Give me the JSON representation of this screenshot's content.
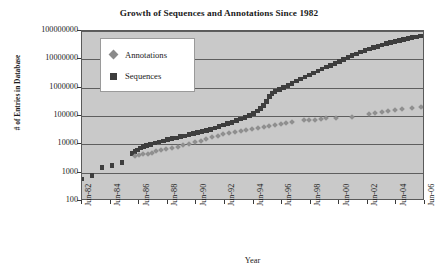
{
  "chart_data": {
    "type": "scatter",
    "title": "Growth of Sequences and Annotations Since 1982",
    "xlabel": "Year",
    "ylabel": "# of Entries in Database",
    "yscale": "log",
    "ylim": [
      100,
      100000000
    ],
    "ytick_labels": [
      "100000000",
      "10000000",
      "1000000",
      "100000",
      "10000",
      "1000",
      "100"
    ],
    "ytick_values": [
      100000000,
      10000000,
      1000000,
      100000,
      10000,
      1000,
      100
    ],
    "grid": true,
    "xtick_labels": [
      "Jun-82",
      "Jun-84",
      "Jun-86",
      "Jun-88",
      "Jun-90",
      "Jun-92",
      "Jun-94",
      "Jun-96",
      "Jun-98",
      "Jun-00",
      "Jun-02",
      "Jun-04",
      "Jun-06"
    ],
    "xtick_values": [
      1982.5,
      1984.5,
      1986.5,
      1988.5,
      1990.5,
      1992.5,
      1994.5,
      1996.5,
      1998.5,
      2000.5,
      2002.5,
      2004.5,
      2006.5
    ],
    "xlim": [
      1982.5,
      2006.5
    ],
    "legend_position": "upper-left",
    "series": [
      {
        "name": "Sequences",
        "marker": "square",
        "color": "#3d3d3d",
        "points": [
          [
            1982.5,
            606
          ],
          [
            1983.2,
            800
          ],
          [
            1983.9,
            1500
          ],
          [
            1984.6,
            1800
          ],
          [
            1985.3,
            2300
          ],
          [
            1986.0,
            4800
          ],
          [
            1986.2,
            5500
          ],
          [
            1986.4,
            6400
          ],
          [
            1986.6,
            7300
          ],
          [
            1986.8,
            8200
          ],
          [
            1987.0,
            9100
          ],
          [
            1987.3,
            10000
          ],
          [
            1987.6,
            11000
          ],
          [
            1987.9,
            12000
          ],
          [
            1988.2,
            13200
          ],
          [
            1988.5,
            14500
          ],
          [
            1988.8,
            15800
          ],
          [
            1989.1,
            17000
          ],
          [
            1989.4,
            18500
          ],
          [
            1989.7,
            20000
          ],
          [
            1990.0,
            22000
          ],
          [
            1990.3,
            24000
          ],
          [
            1990.6,
            26000
          ],
          [
            1990.9,
            28500
          ],
          [
            1991.2,
            31000
          ],
          [
            1991.5,
            34000
          ],
          [
            1991.8,
            38000
          ],
          [
            1992.1,
            43000
          ],
          [
            1992.4,
            48000
          ],
          [
            1992.7,
            54000
          ],
          [
            1993.0,
            60000
          ],
          [
            1993.3,
            68000
          ],
          [
            1993.6,
            78000
          ],
          [
            1993.9,
            90000
          ],
          [
            1994.2,
            105000
          ],
          [
            1994.5,
            125000
          ],
          [
            1994.8,
            150000
          ],
          [
            1995.0,
            180000
          ],
          [
            1995.2,
            230000
          ],
          [
            1995.4,
            320000
          ],
          [
            1995.6,
            480000
          ],
          [
            1995.8,
            620000
          ],
          [
            1996.0,
            720000
          ],
          [
            1996.3,
            850000
          ],
          [
            1996.6,
            1000000
          ],
          [
            1996.9,
            1200000
          ],
          [
            1997.2,
            1400000
          ],
          [
            1997.5,
            1700000
          ],
          [
            1997.8,
            2000000
          ],
          [
            1998.1,
            2400000
          ],
          [
            1998.4,
            2800000
          ],
          [
            1998.7,
            3300000
          ],
          [
            1999.0,
            3900000
          ],
          [
            1999.3,
            4500000
          ],
          [
            1999.6,
            5300000
          ],
          [
            1999.9,
            6200000
          ],
          [
            2000.2,
            7200000
          ],
          [
            2000.5,
            8400000
          ],
          [
            2000.8,
            9800000
          ],
          [
            2001.1,
            11500000
          ],
          [
            2001.4,
            13500000
          ],
          [
            2001.7,
            15500000
          ],
          [
            2002.0,
            18000000
          ],
          [
            2002.3,
            20500000
          ],
          [
            2002.6,
            23000000
          ],
          [
            2002.9,
            26000000
          ],
          [
            2003.2,
            29000000
          ],
          [
            2003.5,
            32000000
          ],
          [
            2003.8,
            35500000
          ],
          [
            2004.1,
            39000000
          ],
          [
            2004.4,
            42500000
          ],
          [
            2004.7,
            46000000
          ],
          [
            2005.0,
            50000000
          ],
          [
            2005.3,
            54000000
          ],
          [
            2005.6,
            58000000
          ],
          [
            2005.9,
            62000000
          ],
          [
            2006.2,
            67000000
          ],
          [
            2006.5,
            72000000
          ]
        ]
      },
      {
        "name": "Annotations",
        "marker": "diamond",
        "color": "#8f8f8f",
        "points": [
          [
            1986.2,
            3900
          ],
          [
            1986.5,
            4100
          ],
          [
            1986.8,
            4400
          ],
          [
            1987.1,
            4700
          ],
          [
            1987.4,
            5100
          ],
          [
            1987.7,
            5600
          ],
          [
            1988.0,
            6100
          ],
          [
            1988.4,
            6700
          ],
          [
            1988.8,
            7400
          ],
          [
            1989.2,
            8200
          ],
          [
            1989.6,
            9200
          ],
          [
            1990.0,
            10500
          ],
          [
            1990.4,
            12000
          ],
          [
            1990.8,
            13500
          ],
          [
            1991.2,
            15500
          ],
          [
            1991.6,
            17500
          ],
          [
            1992.0,
            20000
          ],
          [
            1992.4,
            22500
          ],
          [
            1992.8,
            25000
          ],
          [
            1993.2,
            27500
          ],
          [
            1993.6,
            30000
          ],
          [
            1994.0,
            33000
          ],
          [
            1994.4,
            36000
          ],
          [
            1994.8,
            39000
          ],
          [
            1995.2,
            42000
          ],
          [
            1995.6,
            44000
          ],
          [
            1996.0,
            49000
          ],
          [
            1996.4,
            52000
          ],
          [
            1996.8,
            56000
          ],
          [
            1997.2,
            60000
          ],
          [
            1998.0,
            70000
          ],
          [
            1998.4,
            72000
          ],
          [
            1998.8,
            74000
          ],
          [
            1999.2,
            78000
          ],
          [
            1999.6,
            82000
          ],
          [
            2000.3,
            86000
          ],
          [
            2001.4,
            94000
          ],
          [
            2002.6,
            120000
          ],
          [
            2003.0,
            128000
          ],
          [
            2003.5,
            140000
          ],
          [
            2003.9,
            150000
          ],
          [
            2004.4,
            160000
          ],
          [
            2004.9,
            170000
          ],
          [
            2005.6,
            185000
          ],
          [
            2006.2,
            200000
          ],
          [
            2006.4,
            210000
          ]
        ]
      }
    ]
  }
}
